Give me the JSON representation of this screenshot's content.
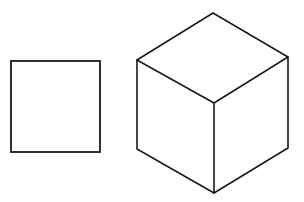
{
  "figure": {
    "background": "#ffffff",
    "stroke_color": "#1a1a1a",
    "shapes": [
      {
        "name": "square",
        "type": "rect",
        "x": 11,
        "y": 61,
        "width": 89,
        "height": 91
      },
      {
        "name": "isometric-cube",
        "type": "cube",
        "vertices": {
          "top": [
            213,
            13
          ],
          "upper_left": [
            137,
            60
          ],
          "upper_right": [
            288,
            57
          ],
          "center": [
            214,
            103
          ],
          "bottom_left": [
            137,
            149
          ],
          "bottom_right": [
            288,
            148
          ],
          "bottom": [
            214,
            193
          ]
        }
      }
    ]
  }
}
